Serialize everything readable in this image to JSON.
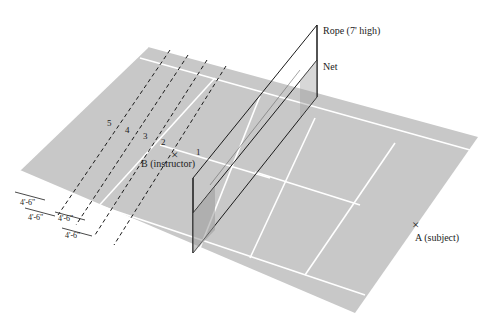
{
  "diagram": {
    "type": "tennis-court-perspective",
    "colors": {
      "court": "#c8c8c8",
      "lines": "#ffffff",
      "ink": "#1a1a1a",
      "background": "#ffffff"
    },
    "labels": {
      "rope": "Rope (7' high)",
      "net": "Net",
      "instructor": "B (instructor)",
      "subject": "A (subject)"
    },
    "positions": [
      "1",
      "2",
      "3",
      "4",
      "5"
    ],
    "spacings": [
      "4'-6\"",
      "4'-6\"",
      "4'-6\"",
      "4'-6\""
    ],
    "markers": {
      "instructor_mark": "×",
      "subject_mark": "×"
    }
  }
}
